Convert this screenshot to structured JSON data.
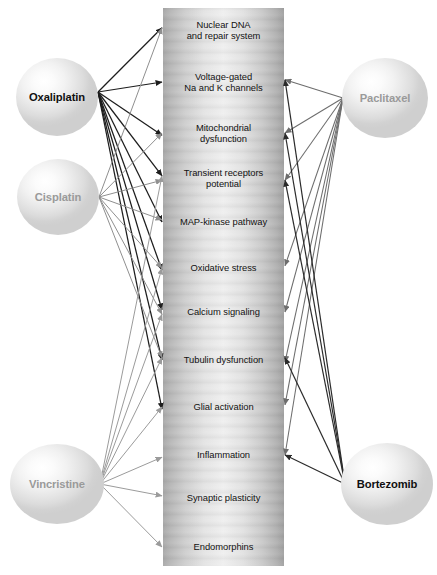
{
  "figure": {
    "type": "bipartite-arrow-diagram"
  },
  "column": {
    "name": "mechanisms-column",
    "mechanisms": [
      {
        "id": "nuclear-dna",
        "label": "Nuclear DNA\nand repair system",
        "y": 30
      },
      {
        "id": "voltage-gated",
        "label": "Voltage-gated\nNa and K channels",
        "y": 82
      },
      {
        "id": "mitochondrial",
        "label": "Mitochondrial\ndysfunction",
        "y": 133
      },
      {
        "id": "transient-receptors",
        "label": "Transient receptors\npotential",
        "y": 178
      },
      {
        "id": "map-kinase",
        "label": "MAP-kinase pathway",
        "y": 222
      },
      {
        "id": "oxidative-stress",
        "label": "Oxidative stress",
        "y": 268
      },
      {
        "id": "calcium-signaling",
        "label": "Calcium signaling",
        "y": 312
      },
      {
        "id": "tubulin",
        "label": "Tubulin dysfunction",
        "y": 360
      },
      {
        "id": "glial-activation",
        "label": "Glial activation",
        "y": 407
      },
      {
        "id": "inflammation",
        "label": "Inflammation",
        "y": 455
      },
      {
        "id": "synaptic-plasticity",
        "label": "Synaptic plasticity",
        "y": 498
      },
      {
        "id": "endomorphins",
        "label": "Endomorphins",
        "y": 547
      }
    ]
  },
  "drugs": [
    {
      "id": "oxaliplatin",
      "label": "Oxaliplatin",
      "side": "left",
      "cx": 57,
      "cy": 97,
      "rx": 41,
      "ry": 39,
      "emphasis": "bold",
      "hub": [
        98,
        92
      ],
      "targets": [
        "nuclear-dna",
        "voltage-gated",
        "mitochondrial",
        "transient-receptors",
        "map-kinase",
        "oxidative-stress",
        "calcium-signaling",
        "tubulin",
        "glial-activation"
      ],
      "color": "#1d1d1d",
      "width": 1.25
    },
    {
      "id": "cisplatin",
      "label": "Cisplatin",
      "side": "left",
      "cx": 58,
      "cy": 197,
      "rx": 41,
      "ry": 38,
      "emphasis": "light",
      "hub": [
        99,
        197
      ],
      "targets": [
        "nuclear-dna",
        "mitochondrial",
        "transient-receptors",
        "map-kinase",
        "oxidative-stress",
        "calcium-signaling",
        "tubulin"
      ],
      "color": "#8f8f8f",
      "width": 1.0
    },
    {
      "id": "vincristine",
      "label": "Vincristine",
      "side": "left",
      "cx": 57,
      "cy": 484,
      "rx": 47,
      "ry": 40,
      "emphasis": "light",
      "hub": [
        100,
        484
      ],
      "targets": [
        "transient-receptors",
        "oxidative-stress",
        "calcium-signaling",
        "tubulin",
        "glial-activation",
        "inflammation",
        "synaptic-plasticity",
        "endomorphins"
      ],
      "color": "#9b9b9b",
      "width": 1.0
    },
    {
      "id": "paclitaxel",
      "label": "Paclitaxel",
      "side": "right",
      "cx": 385,
      "cy": 98,
      "rx": 43,
      "ry": 40,
      "emphasis": "light",
      "hub": [
        343,
        98
      ],
      "targets": [
        "voltage-gated",
        "mitochondrial",
        "transient-receptors",
        "oxidative-stress",
        "calcium-signaling",
        "tubulin",
        "glial-activation",
        "inflammation"
      ],
      "color": "#6d6d6d",
      "width": 1.05
    },
    {
      "id": "bortezomib",
      "label": "Bortezomib",
      "side": "right",
      "cx": 387,
      "cy": 484,
      "rx": 46,
      "ry": 41,
      "emphasis": "bold",
      "hub": [
        345,
        484
      ],
      "targets": [
        "voltage-gated",
        "mitochondrial",
        "transient-receptors",
        "tubulin",
        "inflammation"
      ],
      "color": "#2b2b2b",
      "width": 1.2
    }
  ],
  "geometry": {
    "column_left": 163,
    "column_right": 284,
    "column_top": 8,
    "column_bottom": 566
  }
}
